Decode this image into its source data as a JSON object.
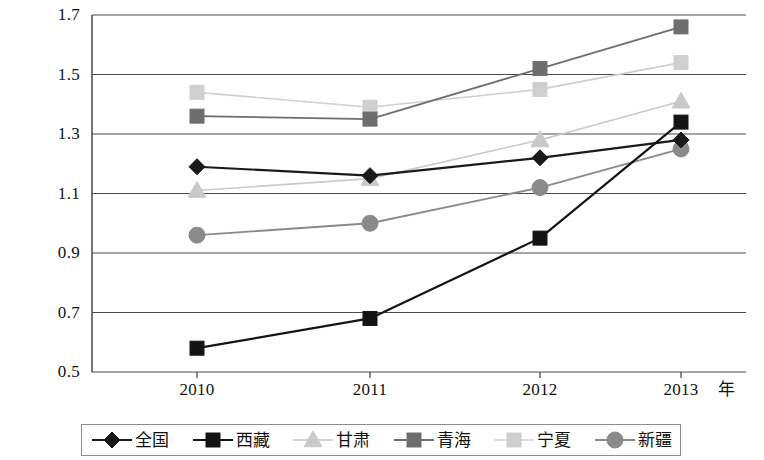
{
  "chart_data": {
    "type": "line",
    "title": "",
    "subtitle": "",
    "xlabel": "年",
    "ylabel": "",
    "categories": [
      "2010",
      "2011",
      "2012",
      "2013"
    ],
    "x": [
      2010,
      2011,
      2012,
      2013
    ],
    "ylim": [
      0.5,
      1.7
    ],
    "yticks": [
      "0.5",
      "0.7",
      "0.9",
      "1.1",
      "1.3",
      "1.5",
      "1.7"
    ],
    "ytick_values": [
      0.5,
      0.7,
      0.9,
      1.1,
      1.3,
      1.5,
      1.7
    ],
    "grid": "horizontal",
    "legend_position": "bottom",
    "series": [
      {
        "name": "全国",
        "marker": "diamond",
        "color": "#1a1a1a",
        "line_width": 2.2,
        "values": [
          1.19,
          1.16,
          1.22,
          1.28
        ]
      },
      {
        "name": "西藏",
        "marker": "square",
        "color": "#141414",
        "line_width": 2.2,
        "values": [
          0.58,
          0.68,
          0.95,
          1.34
        ]
      },
      {
        "name": "甘肃",
        "marker": "triangle",
        "color": "#c9c9c9",
        "line_width": 1.6,
        "values": [
          1.11,
          1.15,
          1.28,
          1.41
        ]
      },
      {
        "name": "青海",
        "marker": "square",
        "color": "#6e6e6e",
        "line_width": 1.8,
        "values": [
          1.36,
          1.35,
          1.52,
          1.66
        ]
      },
      {
        "name": "宁夏",
        "marker": "square",
        "color": "#cfcfcf",
        "line_width": 1.6,
        "values": [
          1.44,
          1.39,
          1.45,
          1.54
        ]
      },
      {
        "name": "新疆",
        "marker": "circle",
        "color": "#8a8a8a",
        "line_width": 1.8,
        "values": [
          0.96,
          1.0,
          1.12,
          1.25
        ]
      }
    ]
  },
  "axis": {
    "x_unit_label": "年"
  }
}
